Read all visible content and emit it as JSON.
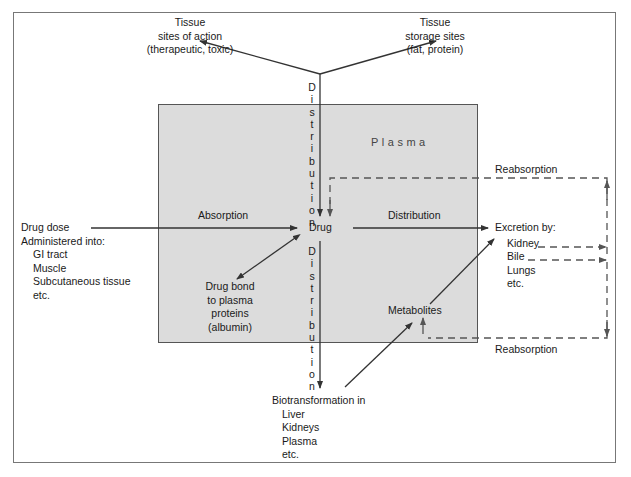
{
  "diagram": {
    "plasma_label": "Plasma",
    "center_label": "Drug",
    "tissue_action": {
      "line1": "Tissue",
      "line2": "sites of action",
      "line3": "(therapeutic, toxic)"
    },
    "tissue_storage": {
      "line1": "Tissue",
      "line2": "storage sites",
      "line3": "(fat, protein)"
    },
    "distribution_vertical_top": "D\ni\ns\nt\nr\ni\nb\nu\nt\ni\no\nn",
    "distribution_vertical_bottom": "D\ni\ns\nt\nr\ni\nb\nu\nt\ni\no\nn",
    "absorption_label": "Absorption",
    "distribution_label": "Distribution",
    "drug_dose": {
      "line1": "Drug dose",
      "line2": "Administered into:",
      "items": [
        "GI tract",
        "Muscle",
        "Subcutaneous tissue",
        "etc."
      ]
    },
    "protein_bound": {
      "line1": "Drug bond",
      "line2": "to plasma",
      "line3": "proteins",
      "line4": "(albumin)"
    },
    "excretion": {
      "title": "Excretion by:",
      "items": [
        "Kidney",
        "Bile",
        "Lungs",
        "etc."
      ]
    },
    "reabsorption_top": "Reabsorption",
    "reabsorption_bottom": "Reabsorption",
    "metabolites_label": "Metabolites",
    "biotransformation": {
      "title": "Biotransformation in",
      "items": [
        "Liver",
        "Kidneys",
        "Plasma",
        "etc."
      ]
    }
  },
  "colors": {
    "plasma_fill": "#dcdcdc",
    "line": "#333333",
    "dashed": "#555555",
    "frame": "#777777"
  }
}
